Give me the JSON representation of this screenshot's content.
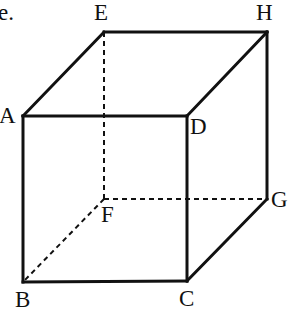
{
  "figure": {
    "kind": "cube-diagram",
    "item_label": "e.",
    "background_color": "#ffffff",
    "stroke_color": "#111111",
    "solid_stroke_width": 3,
    "dashed_stroke_width": 2,
    "dash_pattern": "5,4",
    "width": 291,
    "height": 310
  },
  "vertices": {
    "A": {
      "label": "A",
      "x": 23,
      "y": 116
    },
    "B": {
      "label": "B",
      "x": 23,
      "y": 282
    },
    "C": {
      "label": "C",
      "x": 187,
      "y": 281
    },
    "D": {
      "label": "D",
      "x": 187,
      "y": 116
    },
    "E": {
      "label": "E",
      "x": 104,
      "y": 32
    },
    "F": {
      "label": "F",
      "x": 104,
      "y": 199
    },
    "G": {
      "label": "G",
      "x": 267,
      "y": 199
    },
    "H": {
      "label": "H",
      "x": 267,
      "y": 32
    }
  },
  "edges": {
    "solid": [
      {
        "name": "edge-A-B",
        "from": "A",
        "to": "B"
      },
      {
        "name": "edge-B-C",
        "from": "B",
        "to": "C"
      },
      {
        "name": "edge-C-D",
        "from": "C",
        "to": "D"
      },
      {
        "name": "edge-D-A",
        "from": "D",
        "to": "A"
      },
      {
        "name": "edge-A-E",
        "from": "A",
        "to": "E"
      },
      {
        "name": "edge-E-H",
        "from": "E",
        "to": "H"
      },
      {
        "name": "edge-D-H",
        "from": "D",
        "to": "H"
      },
      {
        "name": "edge-H-G",
        "from": "H",
        "to": "G"
      },
      {
        "name": "edge-G-C",
        "from": "G",
        "to": "C"
      }
    ],
    "dashed": [
      {
        "name": "edge-E-F",
        "from": "E",
        "to": "F"
      },
      {
        "name": "edge-F-G",
        "from": "F",
        "to": "G"
      },
      {
        "name": "edge-F-B",
        "from": "F",
        "to": "B"
      }
    ]
  }
}
